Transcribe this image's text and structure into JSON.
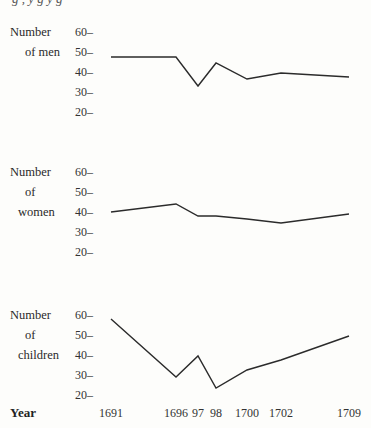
{
  "chart_data": [
    {
      "type": "line",
      "title": "",
      "ylabel": [
        "Number",
        "of men"
      ],
      "xlabel": "Year",
      "x": [
        1691,
        1696,
        1697,
        1698,
        1700,
        1702,
        1709
      ],
      "values": [
        47.5,
        47.5,
        33,
        44.5,
        36.5,
        39.5,
        37.5
      ],
      "ylim": [
        20,
        60
      ],
      "yticks": [
        "60",
        "50",
        "40",
        "30",
        "20"
      ],
      "grid": false
    },
    {
      "type": "line",
      "title": "",
      "ylabel": [
        "Number",
        "of",
        "women"
      ],
      "xlabel": "Year",
      "x": [
        1691,
        1696,
        1697,
        1698,
        1700,
        1702,
        1709
      ],
      "values": [
        40,
        44,
        38,
        38,
        36.5,
        34.5,
        39
      ],
      "ylim": [
        20,
        60
      ],
      "yticks": [
        "60",
        "50",
        "40",
        "30",
        "20"
      ],
      "grid": false
    },
    {
      "type": "line",
      "title": "",
      "ylabel": [
        "Number",
        "of",
        "children"
      ],
      "xlabel": "Year",
      "x": [
        1691,
        1696,
        1697,
        1698,
        1700,
        1702,
        1709
      ],
      "values": [
        58,
        29,
        39.5,
        23.5,
        32.5,
        37.5,
        49.5
      ],
      "ylim": [
        20,
        60
      ],
      "yticks": [
        "60",
        "50",
        "40",
        "30",
        "20"
      ],
      "grid": false
    }
  ],
  "x_axis": {
    "title": "Year",
    "tick_labels": [
      "1691",
      "1696",
      "97",
      "98",
      "1700",
      "1702",
      "1709"
    ]
  },
  "tick_suffix": "–",
  "caption_fragment": "g  ,  y  g  y  g"
}
